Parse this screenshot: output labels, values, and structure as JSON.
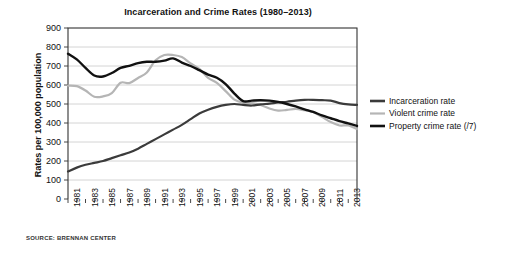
{
  "figure": {
    "title": "Incarceration and Crime Rates (1980–2013)",
    "source_note": "SOURCE: BRENNAN CENTER",
    "ylabel": "Rates per 100,000 population"
  },
  "legend": {
    "position": "right",
    "items": [
      {
        "label": "Incarceration rate",
        "color": "#3b3b3b"
      },
      {
        "label": "Violent crime rate",
        "color": "#b5b5b5"
      },
      {
        "label": "Property crime rate (/7)",
        "color": "#111111"
      }
    ]
  },
  "chart_data": {
    "type": "line",
    "title": "Incarceration and Crime Rates (1980–2013)",
    "xlabel": "",
    "ylabel": "Rates per 100,000 population",
    "source": "SOURCE: BRENNAN CENTER",
    "ylim": [
      0,
      900
    ],
    "ytick_values": [
      0,
      100,
      200,
      300,
      400,
      500,
      600,
      700,
      800,
      900
    ],
    "ytick_labels": [
      "0",
      "100",
      "200",
      "300",
      "400",
      "500",
      "600",
      "700",
      "800",
      "900"
    ],
    "grid": true,
    "grid_axis": "y",
    "xlim": [
      1980,
      2013
    ],
    "x": [
      1980,
      1981,
      1982,
      1983,
      1984,
      1985,
      1986,
      1987,
      1988,
      1989,
      1990,
      1991,
      1992,
      1993,
      1994,
      1995,
      1996,
      1997,
      1998,
      1999,
      2000,
      2001,
      2002,
      2003,
      2004,
      2005,
      2006,
      2007,
      2008,
      2009,
      2010,
      2011,
      2012,
      2013
    ],
    "xtick_values": [
      1980,
      1981,
      1982,
      1983,
      1984,
      1985,
      1986,
      1987,
      1988,
      1989,
      1990,
      1991,
      1992,
      1993,
      1994,
      1995,
      1996,
      1997,
      1998,
      1999,
      2000,
      2001,
      2002,
      2003,
      2004,
      2005,
      2006,
      2007,
      2008,
      2009,
      2010,
      2011,
      2012,
      2013
    ],
    "xtick_labels_shown": [
      "1981",
      "1983",
      "1985",
      "1987",
      "1989",
      "1991",
      "1993",
      "1995",
      "1997",
      "1999",
      "2001",
      "2003",
      "2005",
      "2007",
      "2009",
      "2011",
      "2013"
    ],
    "xtick_label_rotation": -90,
    "series": [
      {
        "name": "Incarceration rate",
        "color": "#3b3b3b",
        "width": 2.2,
        "values": [
          145,
          165,
          180,
          190,
          200,
          215,
          230,
          245,
          265,
          290,
          315,
          340,
          365,
          390,
          420,
          450,
          470,
          485,
          495,
          500,
          495,
          492,
          498,
          502,
          508,
          512,
          518,
          522,
          522,
          520,
          518,
          505,
          498,
          495
        ]
      },
      {
        "name": "Violent crime rate",
        "color": "#b5b5b5",
        "width": 2.2,
        "values": [
          597,
          594,
          571,
          538,
          540,
          557,
          612,
          610,
          637,
          666,
          730,
          758,
          758,
          747,
          714,
          685,
          637,
          611,
          568,
          523,
          507,
          505,
          495,
          476,
          465,
          469,
          474,
          467,
          458,
          432,
          405,
          387,
          387,
          368
        ]
      },
      {
        "name": "Property crime rate (/7)",
        "color": "#111111",
        "width": 2.4,
        "values": [
          765,
          735,
          690,
          650,
          645,
          663,
          690,
          701,
          715,
          722,
          722,
          728,
          740,
          718,
          700,
          678,
          655,
          638,
          605,
          555,
          515,
          518,
          520,
          518,
          511,
          500,
          487,
          472,
          458,
          440,
          425,
          410,
          398,
          385
        ]
      }
    ]
  }
}
